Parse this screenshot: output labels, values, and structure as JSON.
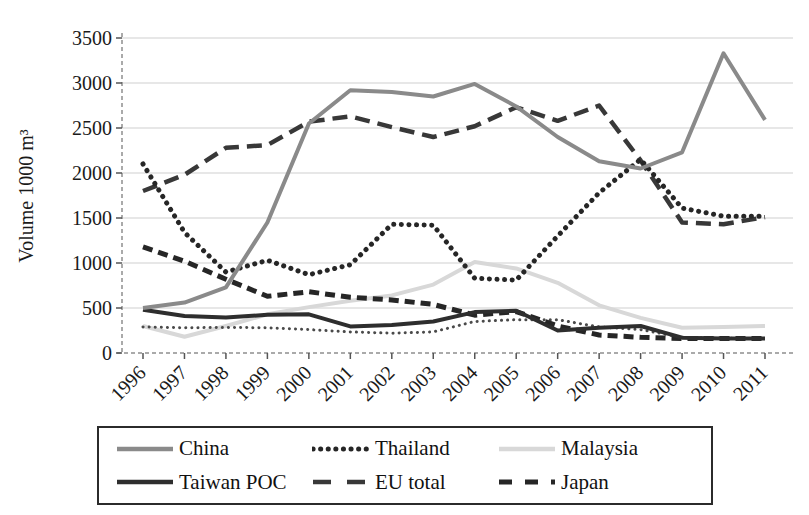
{
  "figure": {
    "background": "#ffffff"
  },
  "chart_data": {
    "type": "line",
    "title": "",
    "xlabel": "",
    "ylabel": "Volume 1000 m³",
    "x": [
      1996,
      1997,
      1998,
      1999,
      2000,
      2001,
      2002,
      2003,
      2004,
      2005,
      2006,
      2007,
      2008,
      2009,
      2010,
      2011
    ],
    "ylim": [
      0,
      3500
    ],
    "yticks": [
      0,
      500,
      1000,
      1500,
      2000,
      2500,
      3000,
      3500
    ],
    "grid": true,
    "legend_position": "bottom-box",
    "colors": {
      "china": "#8a8a8a",
      "thailand": "#262626",
      "malaysia": "#d8d8d8",
      "taiwan_poc": "#2e2e2e",
      "eu_total": "#383838",
      "japan": "#262626",
      "unlabeled": "#4a4a4a",
      "gridline": "#cfcfcf",
      "axis": "#8f8f8f",
      "text": "#1a1a1a"
    },
    "series": [
      {
        "name": "Malaysia",
        "style": "solid",
        "color": "#d8d8d8",
        "width": 4,
        "values": [
          300,
          180,
          300,
          430,
          510,
          580,
          640,
          760,
          1010,
          940,
          780,
          530,
          390,
          280,
          290,
          300
        ]
      },
      {
        "name": "",
        "style": "fine-dotted",
        "color": "#4a4a4a",
        "width": 3,
        "in_legend": false,
        "note": "unlabeled low dotted line visible in plot",
        "values": [
          290,
          280,
          285,
          280,
          260,
          235,
          220,
          235,
          350,
          370,
          370,
          290,
          260,
          175,
          165,
          160
        ]
      },
      {
        "name": "Japan",
        "style": "short-dash",
        "color": "#262626",
        "width": 5,
        "values": [
          1180,
          1020,
          820,
          630,
          680,
          620,
          590,
          540,
          420,
          460,
          300,
          200,
          175,
          160,
          160,
          160
        ]
      },
      {
        "name": "EU total",
        "style": "long-dash",
        "color": "#383838",
        "width": 4.5,
        "values": [
          1800,
          1980,
          2280,
          2310,
          2570,
          2630,
          2510,
          2400,
          2520,
          2730,
          2580,
          2750,
          2140,
          1450,
          1430,
          1510
        ]
      },
      {
        "name": "Thailand",
        "style": "dotted",
        "color": "#262626",
        "width": 5,
        "values": [
          2100,
          1340,
          900,
          1030,
          870,
          980,
          1430,
          1420,
          830,
          810,
          1300,
          1780,
          2150,
          1610,
          1520,
          1520
        ]
      },
      {
        "name": "Taiwan POC",
        "style": "solid",
        "color": "#2e2e2e",
        "width": 4,
        "values": [
          480,
          410,
          395,
          425,
          430,
          295,
          310,
          350,
          455,
          470,
          250,
          280,
          300,
          170,
          160,
          160
        ]
      },
      {
        "name": "China",
        "style": "solid",
        "color": "#8a8a8a",
        "width": 4,
        "values": [
          500,
          560,
          730,
          1450,
          2550,
          2920,
          2900,
          2850,
          2990,
          2740,
          2400,
          2130,
          2050,
          2230,
          3330,
          2590
        ]
      }
    ],
    "legend_rows": [
      [
        "China",
        "Thailand",
        "Malaysia"
      ],
      [
        "Taiwan POC",
        "EU total",
        "Japan"
      ]
    ]
  }
}
